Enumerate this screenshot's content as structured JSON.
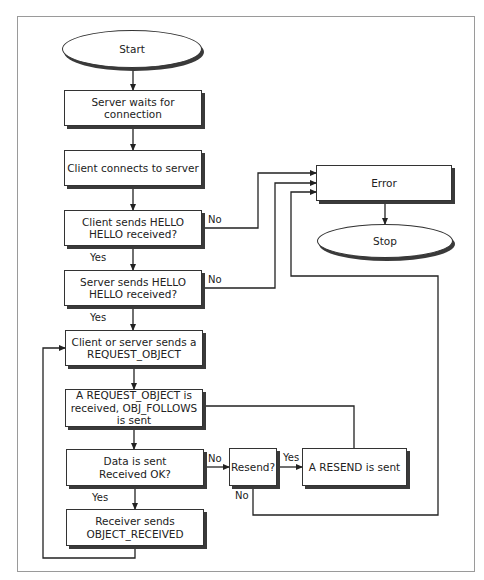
{
  "diagram": {
    "type": "flowchart",
    "nodes": [
      {
        "id": "start",
        "kind": "terminal",
        "text": "Start",
        "x": 62,
        "y": 30,
        "w": 140,
        "h": 38
      },
      {
        "id": "wait",
        "kind": "process",
        "text": "Server waits for connection",
        "x": 64,
        "y": 90,
        "w": 138,
        "h": 36
      },
      {
        "id": "connect",
        "kind": "process",
        "text": "Client connects to server",
        "x": 64,
        "y": 150,
        "w": 138,
        "h": 36
      },
      {
        "id": "client_hello",
        "kind": "decision",
        "text": "Client sends HELLO\nHELLO received?",
        "x": 64,
        "y": 210,
        "w": 138,
        "h": 36
      },
      {
        "id": "server_hello",
        "kind": "decision",
        "text": "Server sends HELLO\nHELLO received?",
        "x": 64,
        "y": 270,
        "w": 138,
        "h": 36
      },
      {
        "id": "request",
        "kind": "process",
        "text": "Client or server sends a\nREQUEST_OBJECT",
        "x": 65,
        "y": 330,
        "w": 138,
        "h": 36
      },
      {
        "id": "obj_follows",
        "kind": "process",
        "text": "A REQUEST_OBJECT is\nreceived, OBJ_FOLLOWS\nis sent",
        "x": 65,
        "y": 389,
        "w": 138,
        "h": 38
      },
      {
        "id": "data_sent",
        "kind": "decision",
        "text": "Data is sent\nReceived OK?",
        "x": 66,
        "y": 449,
        "w": 138,
        "h": 37
      },
      {
        "id": "obj_received",
        "kind": "process",
        "text": "Receiver sends\nOBJECT_RECEIVED",
        "x": 66,
        "y": 509,
        "w": 138,
        "h": 37
      },
      {
        "id": "resend_q",
        "kind": "decision",
        "text": "Resend?",
        "x": 229,
        "y": 448,
        "w": 48,
        "h": 38
      },
      {
        "id": "resend_sent",
        "kind": "process",
        "text": "A RESEND is sent",
        "x": 302,
        "y": 448,
        "w": 105,
        "h": 38
      },
      {
        "id": "error",
        "kind": "process",
        "text": "Error",
        "x": 316,
        "y": 165,
        "w": 136,
        "h": 36
      },
      {
        "id": "stop",
        "kind": "terminal",
        "text": "Stop",
        "x": 317,
        "y": 224,
        "w": 136,
        "h": 34
      }
    ],
    "edge_labels": [
      {
        "text": "No",
        "x": 208,
        "y": 214
      },
      {
        "text": "Yes",
        "x": 90,
        "y": 252
      },
      {
        "text": "No",
        "x": 208,
        "y": 274
      },
      {
        "text": "Yes",
        "x": 90,
        "y": 312
      },
      {
        "text": "No",
        "x": 208,
        "y": 453
      },
      {
        "text": "Yes",
        "x": 92,
        "y": 492
      },
      {
        "text": "Yes",
        "x": 283,
        "y": 452
      },
      {
        "text": "No",
        "x": 235,
        "y": 490
      }
    ],
    "edges": [
      {
        "from": "start",
        "to": "wait",
        "points": [
          [
            133,
            68
          ],
          [
            133,
            90
          ]
        ],
        "arrow": true
      },
      {
        "from": "wait",
        "to": "connect",
        "points": [
          [
            133,
            126
          ],
          [
            133,
            150
          ]
        ],
        "arrow": true
      },
      {
        "from": "connect",
        "to": "client_hello",
        "points": [
          [
            133,
            186
          ],
          [
            133,
            210
          ]
        ],
        "arrow": true
      },
      {
        "from": "client_hello",
        "to": "server_hello",
        "label": "Yes",
        "points": [
          [
            133,
            246
          ],
          [
            133,
            270
          ]
        ],
        "arrow": true
      },
      {
        "from": "server_hello",
        "to": "request",
        "label": "Yes",
        "points": [
          [
            133,
            306
          ],
          [
            133,
            330
          ]
        ],
        "arrow": true
      },
      {
        "from": "request",
        "to": "obj_follows",
        "points": [
          [
            134,
            366
          ],
          [
            134,
            389
          ]
        ],
        "arrow": true
      },
      {
        "from": "obj_follows",
        "to": "data_sent",
        "points": [
          [
            134,
            427
          ],
          [
            134,
            449
          ]
        ],
        "arrow": true
      },
      {
        "from": "data_sent",
        "to": "obj_received",
        "label": "Yes",
        "points": [
          [
            135,
            486
          ],
          [
            135,
            509
          ]
        ],
        "arrow": true
      },
      {
        "from": "obj_received",
        "to": "request",
        "points": [
          [
            135,
            546
          ],
          [
            135,
            558
          ],
          [
            43,
            558
          ],
          [
            43,
            348
          ],
          [
            65,
            348
          ]
        ],
        "arrow": true
      },
      {
        "from": "client_hello",
        "to": "error",
        "label": "No",
        "points": [
          [
            202,
            228
          ],
          [
            258,
            228
          ],
          [
            258,
            173
          ],
          [
            316,
            173
          ]
        ],
        "arrow": true
      },
      {
        "from": "server_hello",
        "to": "error",
        "label": "No",
        "points": [
          [
            202,
            288
          ],
          [
            275,
            288
          ],
          [
            275,
            183
          ],
          [
            316,
            183
          ]
        ],
        "arrow": true
      },
      {
        "from": "resend_q",
        "to": "error",
        "label": "No",
        "points": [
          [
            253,
            486
          ],
          [
            253,
            515
          ],
          [
            438,
            515
          ],
          [
            438,
            276
          ],
          [
            291,
            276
          ],
          [
            291,
            192
          ],
          [
            316,
            192
          ]
        ],
        "arrow": true
      },
      {
        "from": "data_sent",
        "to": "resend_q",
        "label": "No",
        "points": [
          [
            204,
            467
          ],
          [
            229,
            467
          ]
        ],
        "arrow": true
      },
      {
        "from": "resend_q",
        "to": "resend_sent",
        "label": "Yes",
        "points": [
          [
            277,
            467
          ],
          [
            302,
            467
          ]
        ],
        "arrow": true
      },
      {
        "from": "obj_follows",
        "to": "resend_sent",
        "points": [
          [
            203,
            406
          ],
          [
            354,
            406
          ],
          [
            354,
            448
          ]
        ],
        "arrow": false
      },
      {
        "from": "error",
        "to": "stop",
        "points": [
          [
            385,
            201
          ],
          [
            385,
            224
          ]
        ],
        "arrow": true
      }
    ]
  },
  "style": {
    "line_color": "#222222",
    "frame_color": "#9a9a9a",
    "shadow_color": "#3a3a3a",
    "background": "#ffffff"
  }
}
